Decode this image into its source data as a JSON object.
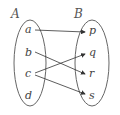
{
  "diagram": {
    "set_a": {
      "label": "A",
      "elements": [
        "a",
        "b",
        "c",
        "d"
      ]
    },
    "set_b": {
      "label": "B",
      "elements": [
        "p",
        "q",
        "r",
        "s"
      ]
    },
    "mappings": [
      {
        "from": "a",
        "to": "p"
      },
      {
        "from": "b",
        "to": "r"
      },
      {
        "from": "c",
        "to": "q"
      },
      {
        "from": "c",
        "to": "s"
      }
    ],
    "colors": {
      "stroke": "#555555",
      "background": "#ffffff"
    }
  }
}
